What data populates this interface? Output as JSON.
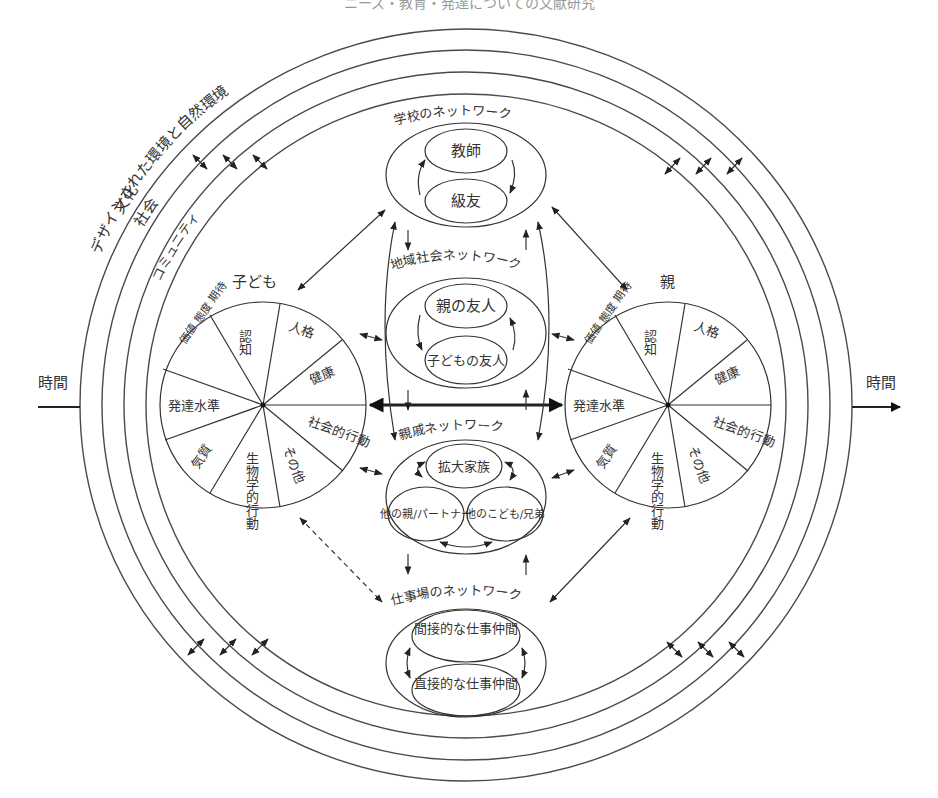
{
  "header": {
    "title_partial": "ニーズ・教育・発達についての文献研究"
  },
  "environment_rings": [
    {
      "label": "デザインされた環境と自然環境"
    },
    {
      "label": "文化"
    },
    {
      "label": "社会"
    },
    {
      "label": "コミュニティ"
    }
  ],
  "time_axis": {
    "left_label": "時間",
    "right_label": "時間"
  },
  "child": {
    "title": "子ども",
    "segments": [
      "認知",
      "人格",
      "健康",
      "社会的行動",
      "その他",
      "生物学的行動",
      "気質",
      "発達水準",
      "価値 態度 期待"
    ]
  },
  "parent": {
    "title": "親",
    "segments": [
      "認知",
      "人格",
      "健康",
      "社会的行動",
      "その他",
      "生物学的行動",
      "気質",
      "発達水準",
      "価値 態度 期待"
    ]
  },
  "networks": {
    "school": {
      "title": "学校のネットワーク",
      "members": [
        "教師",
        "級友"
      ]
    },
    "community": {
      "title": "地域社会ネットワーク",
      "members": [
        "親の友人",
        "子どもの友人"
      ]
    },
    "kin": {
      "title": "親戚ネットワーク",
      "members": [
        "拡大家族",
        "他の親/パートナー",
        "他のこども/兄弟"
      ]
    },
    "work": {
      "title": "仕事場のネットワーク",
      "members": [
        "間接的な仕事仲間",
        "直接的な仕事仲間"
      ]
    }
  },
  "colors": {
    "line": "#333333",
    "background": "#ffffff"
  }
}
